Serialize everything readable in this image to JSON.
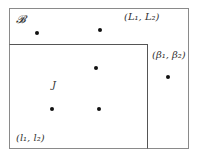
{
  "diagram": {
    "outer_set": {
      "label": "𝓑",
      "corner_label": "(L₁, L₂)"
    },
    "inner_set": {
      "label": "J",
      "corner_label": "(l₁, l₂)"
    },
    "outside_point": {
      "label": "(β₁, β₂)"
    },
    "points": [
      {
        "x": 37,
        "y": 33,
        "region": "outer"
      },
      {
        "x": 100,
        "y": 30,
        "region": "outer"
      },
      {
        "x": 96,
        "y": 68,
        "region": "inner"
      },
      {
        "x": 168,
        "y": 77,
        "region": "outer"
      },
      {
        "x": 52,
        "y": 109,
        "region": "inner"
      },
      {
        "x": 99,
        "y": 109,
        "region": "inner"
      }
    ]
  }
}
